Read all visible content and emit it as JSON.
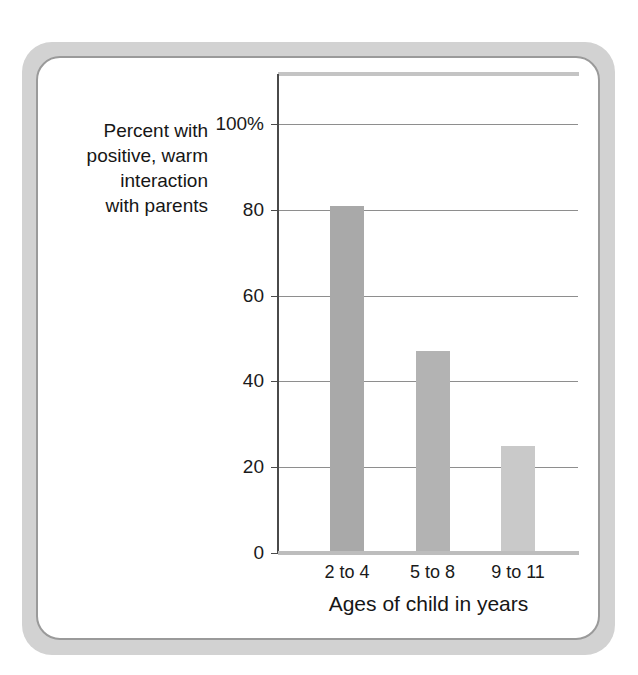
{
  "figure": {
    "card_border_color": "#9a9a9a",
    "frame_band_color": "#d2d2d2"
  },
  "chart_data": {
    "type": "bar",
    "title": "",
    "subtitle": "",
    "xlabel": "Ages of child in years",
    "ylabel": "Percent with positive, warm interaction with parents",
    "ylabel_lines": [
      "Percent with",
      "positive, warm",
      "interaction",
      "with parents"
    ],
    "categories": [
      "2 to 4",
      "5 to 8",
      "9 to 11"
    ],
    "values": [
      81,
      47,
      25
    ],
    "bar_colors": [
      "#a9a9a9",
      "#b3b3b3",
      "#c9c9c9"
    ],
    "ylim": [
      0,
      110
    ],
    "yticks": [
      0,
      20,
      40,
      60,
      80,
      100
    ],
    "ytick_labels": [
      "0",
      "20",
      "40",
      "60",
      "80",
      "100%"
    ],
    "grid": true,
    "grid_axis": "y",
    "legend": false,
    "legend_position": "none",
    "gridline_color": "#8e8e8e",
    "axis_color": "#4a4a4a"
  }
}
